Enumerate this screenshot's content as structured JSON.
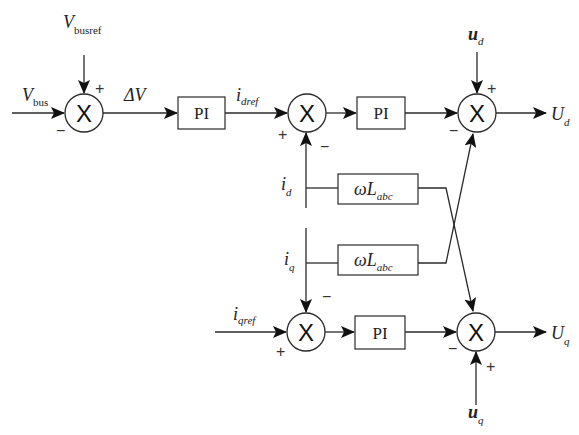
{
  "diagram": {
    "type": "control-block-diagram",
    "blocks": {
      "pi_voltage": "PI",
      "pi_d": "PI",
      "pi_q": "PI",
      "wl_top": {
        "main": "ωL",
        "sub": "abc"
      },
      "wl_bottom": {
        "main": "ωL",
        "sub": "abc"
      }
    },
    "summing_junction_symbol": "X",
    "signals": {
      "vbus": {
        "main": "V",
        "sub": "bus"
      },
      "vbusref": {
        "main": "V",
        "sub": "busref"
      },
      "delta_v": "ΔV",
      "idref": {
        "main": "i",
        "sub": "dref"
      },
      "iqref": {
        "main": "i",
        "sub": "qref"
      },
      "id": {
        "main": "i",
        "sub": "d"
      },
      "iq": {
        "main": "i",
        "sub": "q"
      },
      "ud_in": {
        "main": "u",
        "sub": "d"
      },
      "uq_in": {
        "main": "u",
        "sub": "q"
      },
      "Ud_out": {
        "main": "U",
        "sub": "d"
      },
      "Uq_out": {
        "main": "U",
        "sub": "q"
      }
    },
    "signs": {
      "sum1_vbusref": "+",
      "sum1_vbus": "−",
      "sum2_idref": "+",
      "sum2_id": "−",
      "sum3_ud": "+",
      "sum3_pi": "−",
      "sum4_iq": "−",
      "sum4_iqref": "+",
      "sum5_pi": "−",
      "sum5_uq": "+"
    }
  }
}
